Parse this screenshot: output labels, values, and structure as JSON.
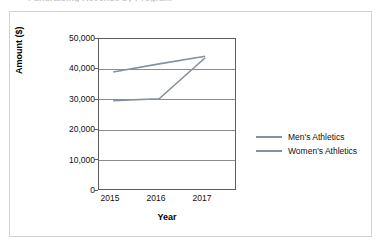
{
  "artifacts": {
    "top_clipped_text": "Fundraising Revenue by Program"
  },
  "chart_data": {
    "type": "line",
    "title": "",
    "xlabel": "Year",
    "ylabel": "Amount ($)",
    "categories": [
      "2015",
      "2016",
      "2017"
    ],
    "ylim": [
      0,
      50000
    ],
    "ytick_labels": [
      "0",
      "10,000",
      "20,000",
      "30,000",
      "40,000",
      "50,000"
    ],
    "ytick_values": [
      0,
      10000,
      20000,
      30000,
      40000,
      50000
    ],
    "grid": "horizontal",
    "legend_position": "right",
    "series": [
      {
        "name": "Men's Athletics",
        "color": "#8691a0",
        "values": [
          38800,
          41500,
          44000
        ]
      },
      {
        "name": "Women's Athletics",
        "color": "#8691a0",
        "values": [
          29400,
          30000,
          43500
        ]
      }
    ]
  }
}
